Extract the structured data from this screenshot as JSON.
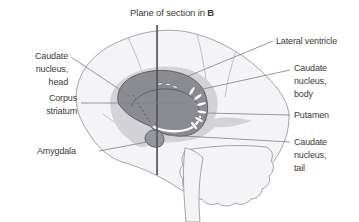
{
  "figure": {
    "type": "anatomical-diagram",
    "plane_label": {
      "text": "Plane of section in",
      "bold_suffix": "B"
    },
    "labels": {
      "caudate_head": {
        "lines": [
          "Caudate",
          "nucleus,",
          "head"
        ]
      },
      "corpus_striatum": {
        "lines": [
          "Corpus",
          "striatum"
        ]
      },
      "amygdala": {
        "lines": [
          "Amygdala"
        ]
      },
      "lateral_ventricle": {
        "lines": [
          "Lateral ventricle"
        ]
      },
      "caudate_body": {
        "lines": [
          "Caudate",
          "nucleus,",
          "body"
        ]
      },
      "putamen": {
        "lines": [
          "Putamen"
        ]
      },
      "caudate_tail": {
        "lines": [
          "Caudate",
          "nucleus,",
          "tail"
        ]
      }
    }
  },
  "colors": {
    "text": "#3b3b39",
    "brain_fill": "#f4f4f6",
    "brain_stroke": "#9a9aa0",
    "sulcus": "#b3b3b8",
    "halo_fill": "#d3d3d7",
    "structure_fill": "#8b8c92",
    "structure_stroke": "#55565c",
    "amygdala_fill": "#95979f",
    "plane_line": "#55555a",
    "leader_line": "#808084"
  }
}
